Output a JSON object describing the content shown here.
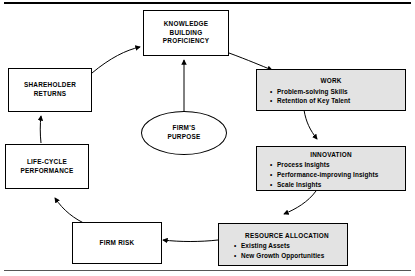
{
  "diagram": {
    "title_rule_top": "",
    "nodes": {
      "knowledge": {
        "title": "KNOWLEDGE\nBUILDING\nPROFICIENCY",
        "line1": "KNOWLEDGE",
        "line2": "BUILDING",
        "line3": "PROFICIENCY",
        "shaded": false
      },
      "work": {
        "title": "WORK",
        "bullets": [
          "Problem-solving Skills",
          "Retention of Key Talent"
        ],
        "shaded": true
      },
      "innovation": {
        "title": "INNOVATION",
        "bullets": [
          "Process Insights",
          "Performance-improving Insights",
          "Scale Insights"
        ],
        "shaded": true
      },
      "resource_allocation": {
        "title": "RESOURCE ALLOCATION",
        "bullets": [
          "Existing Assets",
          "New Growth Opportunities"
        ],
        "shaded": true
      },
      "firm_risk": {
        "title": "FIRM RISK",
        "shaded": false
      },
      "life_cycle": {
        "line1": "LIFE-CYCLE",
        "line2": "PERFORMANCE",
        "shaded": false
      },
      "shareholder": {
        "line1": "SHAREHOLDER",
        "line2": "RETURNS",
        "shaded": false
      },
      "firms_purpose": {
        "line1": "FIRM'S",
        "line2": "PURPOSE"
      }
    },
    "colors": {
      "shaded_fill": "#e3e3e3",
      "stroke": "#000000",
      "background": "#ffffff"
    }
  }
}
